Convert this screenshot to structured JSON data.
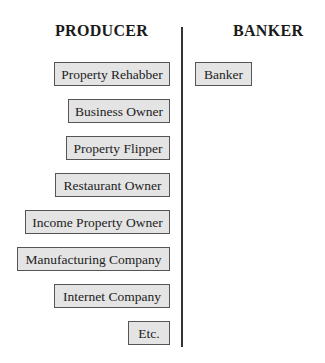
{
  "columns": {
    "producer": {
      "heading": "PRODUCER",
      "items": [
        "Property Rehabber",
        "Business Owner",
        "Property Flipper",
        "Restaurant Owner",
        "Income Property Owner",
        "Manufacturing Company",
        "Internet Company",
        "Etc."
      ]
    },
    "banker": {
      "heading": "BANKER",
      "items": [
        "Banker"
      ]
    }
  },
  "colors": {
    "box_fill": "#e4e4e4",
    "box_border": "#555555",
    "divider": "#333333"
  }
}
